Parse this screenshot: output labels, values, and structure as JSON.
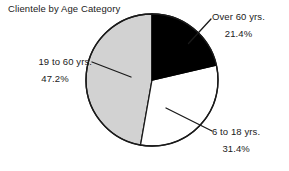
{
  "chart_data": {
    "type": "pie",
    "title": "Clientele by Age Category",
    "xlabel": "",
    "ylabel": "",
    "legend_position": "none",
    "grid": false,
    "start_angle_deg": 0,
    "direction": "clockwise",
    "categories": [
      "Over 60 yrs.",
      "6 to 18 yrs.",
      "19 to 60 yrs."
    ],
    "values": [
      21.4,
      31.4,
      47.2
    ],
    "value_unit": "percent",
    "slices": [
      {
        "label": "Over 60 yrs.",
        "value_label": "21.4%",
        "value": 21.4,
        "color": "#000000",
        "start_deg": 0,
        "end_deg": 77.0
      },
      {
        "label": "6 to 18 yrs.",
        "value_label": "31.4%",
        "value": 31.4,
        "color": "#ffffff",
        "start_deg": 77.0,
        "end_deg": 190.0
      },
      {
        "label": "19 to 60 yrs.",
        "value_label": "47.2%",
        "value": 47.2,
        "color": "#d2d2d2",
        "start_deg": 190.0,
        "end_deg": 360.0
      }
    ]
  },
  "colors": {
    "slice_over_60": "#000000",
    "slice_6_to_18": "#ffffff",
    "slice_19_to_60": "#d2d2d2",
    "outline": "#000000",
    "text": "#1a1a1a",
    "background": "#ffffff"
  },
  "title": {
    "text": "Clientele by Age Category"
  },
  "labels": {
    "over_60": {
      "name": "Over 60 yrs.",
      "percent": "21.4%"
    },
    "age_6_to_18": {
      "name": "6 to 18 yrs.",
      "percent": "31.4%"
    },
    "age_19_to_60": {
      "name": "19 to 60 yrs.",
      "percent": "47.2%"
    }
  }
}
